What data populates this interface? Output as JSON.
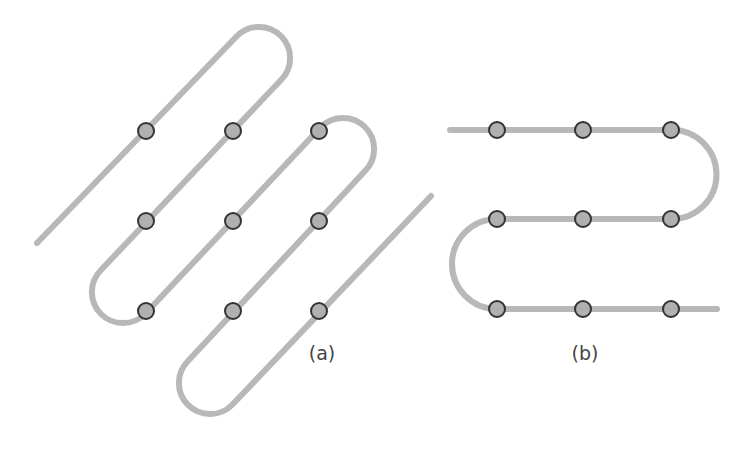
{
  "colors": {
    "path": "#b8b8b8",
    "node_fill": "#b0b0b0",
    "node_stroke": "#333333",
    "label": "#444444"
  },
  "style": {
    "path_width": 6,
    "node_radius": 8,
    "node_stroke_width": 2
  },
  "diagrams": [
    {
      "id": "a",
      "label": "(a)",
      "label_pos": [
        322,
        353
      ],
      "description": "Diagonal zig-zag (boustrophedon) path at 45 degrees through a 3x3 grid of nodes",
      "path_d": "M37,243 L237,36 A31,31 0 0 1 281,80 L101,270 A31,31 0 0 0 145,314 L321,127 A31,31 0 0 1 365,171 L188,361 A31,31 0 0 0 232,405 L431,196",
      "nodes": [
        [
          146,
          131
        ],
        [
          233,
          131
        ],
        [
          319,
          131
        ],
        [
          146,
          221
        ],
        [
          233,
          221
        ],
        [
          319,
          221
        ],
        [
          146,
          311
        ],
        [
          233,
          311
        ],
        [
          319,
          311
        ]
      ]
    },
    {
      "id": "b",
      "label": "(b)",
      "label_pos": [
        585,
        353
      ],
      "description": "Horizontal serpentine path through a 3x3 grid of nodes",
      "path_d": "M450,130 L672,130 A44.5,44.5 0 0 1 672,219 L497,219 A45,45 0 0 0 497,309 L717,309",
      "nodes": [
        [
          497,
          130
        ],
        [
          583,
          130
        ],
        [
          671,
          130
        ],
        [
          497,
          219
        ],
        [
          583,
          219
        ],
        [
          671,
          219
        ],
        [
          497,
          309
        ],
        [
          583,
          309
        ],
        [
          671,
          309
        ]
      ]
    }
  ]
}
